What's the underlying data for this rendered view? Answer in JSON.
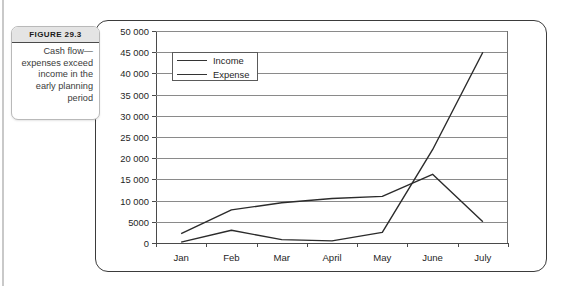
{
  "caption": {
    "title": "Figure 29.3",
    "text": "Cash flow—expenses exceed income in the early planning period"
  },
  "legend": {
    "items": [
      {
        "label": "Income",
        "color": "#333333"
      },
      {
        "label": "Expense",
        "color": "#333333"
      }
    ]
  },
  "chart_data": {
    "type": "line",
    "title": "",
    "xlabel": "",
    "ylabel": "",
    "ylim": [
      0,
      50000
    ],
    "ytick_labels": [
      "50 000",
      "45 000",
      "40 000",
      "35 000",
      "30 000",
      "25 000",
      "20 000",
      "15 000",
      "10 000",
      "5000",
      "0"
    ],
    "ytick_values": [
      50000,
      45000,
      40000,
      35000,
      30000,
      25000,
      20000,
      15000,
      10000,
      5000,
      0
    ],
    "grid": true,
    "legend_position": "top-left",
    "categories": [
      "Jan",
      "Feb",
      "Mar",
      "April",
      "May",
      "June",
      "July"
    ],
    "series": [
      {
        "name": "Income",
        "values": [
          200,
          3000,
          800,
          500,
          2500,
          22000,
          45000
        ]
      },
      {
        "name": "Expense",
        "values": [
          2200,
          7800,
          9500,
          10500,
          11000,
          16200,
          5000
        ]
      }
    ]
  }
}
